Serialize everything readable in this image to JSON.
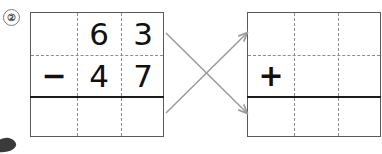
{
  "problem": {
    "number_label": "②",
    "kind": "vertical-arithmetic-worksheet",
    "instruction_visual": "cross-arrows linking subtraction grid to addition grid"
  },
  "colors": {
    "grid_border": "#5a5a5a",
    "dashed_guide": "#8d8d8d",
    "answer_rule": "#1c1c1c",
    "digit": "#111111",
    "arrow": "#9a9a9a",
    "background": "#ffffff"
  },
  "left_grid": {
    "name": "subtraction-problem",
    "columns": 3,
    "rows": 3,
    "row_minuend": [
      "",
      "6",
      "3"
    ],
    "row_subtrahend": [
      "−",
      "4",
      "7"
    ],
    "row_answer": [
      "",
      "",
      ""
    ],
    "operator": "−",
    "operator_name": "minus-sign"
  },
  "right_grid": {
    "name": "addition-check",
    "columns": 3,
    "rows": 3,
    "row_top": [
      "",
      "",
      ""
    ],
    "row_second": [
      "+",
      "",
      ""
    ],
    "row_answer": [
      "",
      "",
      ""
    ],
    "operator": "+",
    "operator_name": "plus-sign"
  },
  "arrows": [
    {
      "name": "arrow-answer-to-addend",
      "from": "left-grid-top-right",
      "to": "right-grid-bottom-left",
      "direction": "down-right"
    },
    {
      "name": "arrow-difference-to-top",
      "from": "left-grid-bottom-right",
      "to": "right-grid-top-left",
      "direction": "up-right"
    }
  ]
}
